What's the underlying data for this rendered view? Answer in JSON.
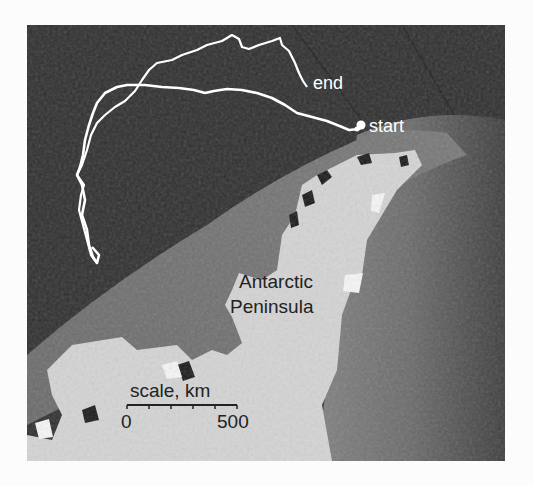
{
  "map": {
    "title": "Antarctic Peninsula track map",
    "labels": {
      "end": "end",
      "start": "start",
      "region_line1": "Antarctic",
      "region_line2": "Peninsula"
    },
    "scale_bar": {
      "title": "scale, km",
      "min_label": "0",
      "max_label": "500",
      "ticks": 6
    },
    "colors": {
      "ocean_deep": "#2e2e2e",
      "ocean_shelf": "#6e6e6e",
      "ocean_right": "#7a7a7a",
      "land_ice": "#d6d6d6",
      "track": "#ffffff",
      "text_dark": "#222222",
      "text_light": "#ffffff"
    }
  }
}
